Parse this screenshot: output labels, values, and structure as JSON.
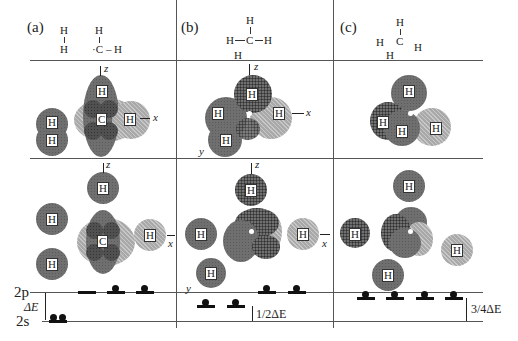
{
  "panels": [
    {
      "label": "(a)",
      "formula": {
        "h2_top": "H",
        "h2_bottom": "H",
        "ch_top": "H",
        "ch_c": "·C",
        "ch_right": "H",
        "ch_bond": "–"
      },
      "axes": {
        "z": "z",
        "x": "x"
      },
      "atoms": {
        "carbon": "C",
        "hydrogen": "H"
      },
      "levels": {
        "upper": "2p",
        "lower": "2s",
        "gap": "ΔE"
      }
    },
    {
      "label": "(b)",
      "formula": {
        "top": "H",
        "left": "H",
        "center": "C",
        "right": "H",
        "bottom": "H"
      },
      "axes": {
        "z": "z",
        "x": "x",
        "y": "y"
      },
      "atoms": {
        "hydrogen": "H"
      },
      "levels": {
        "gap": "1/2ΔE"
      }
    },
    {
      "label": "(c)",
      "formula": {
        "top": "H",
        "left": "H",
        "center": "C",
        "right": "H",
        "bottom": "H"
      },
      "atoms": {
        "hydrogen": "H"
      },
      "levels": {
        "gap": "3/4ΔE"
      }
    }
  ],
  "colors": {
    "line": "#555555",
    "dark_orbital": "#6f6f6f",
    "light_orbital": "#a9a9a9",
    "electron": "#111111"
  }
}
